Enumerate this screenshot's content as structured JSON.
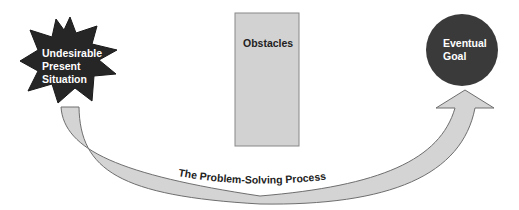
{
  "diagram": {
    "start": {
      "lines": [
        "Undesirable",
        "Present",
        "Situation"
      ],
      "shape": "starburst",
      "fill": "#262626"
    },
    "obstacle": {
      "label": "Obstacles",
      "shape": "rectangle",
      "fill": "#d2d2d2",
      "stroke": "#888888"
    },
    "goal": {
      "lines": [
        "Eventual",
        "Goal"
      ],
      "shape": "circle",
      "fill": "#3a3a3a"
    },
    "process_arrow": {
      "label": "The Problem-Solving Process",
      "fill": "#d4d4d4",
      "stroke": "#6e6e6e"
    }
  }
}
